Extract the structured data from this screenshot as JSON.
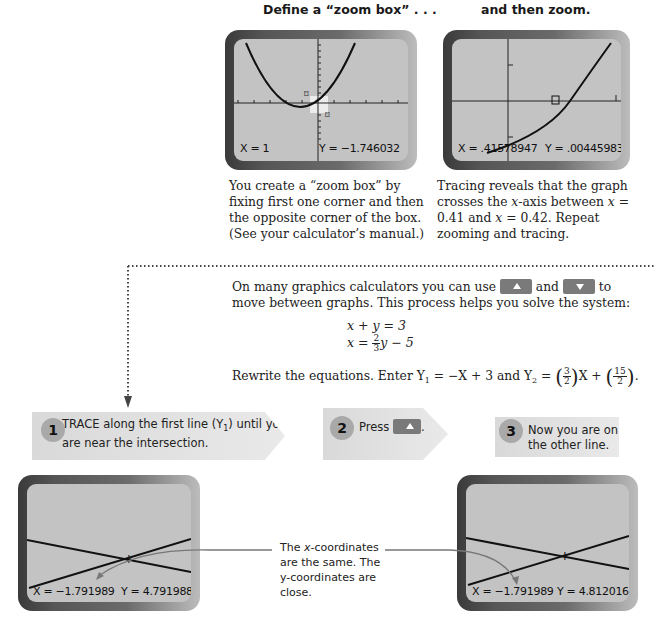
{
  "top": {
    "left_heading": "Define a “zoom box” . . .",
    "right_heading": "and then zoom.",
    "left_screen": {
      "x_readout": "X = 1",
      "y_readout": "Y = −1.746032"
    },
    "right_screen": {
      "x_readout": "X = .41578947",
      "y_readout": "Y = .00445983"
    },
    "left_caption": [
      "You create a “zoom box” by",
      "fixing first one corner and then",
      "the opposite corner of the box.",
      "(See your calculator’s manual.)"
    ],
    "right_caption": {
      "line1": "Tracing reveals that the graph",
      "line2_pre": "crosses the ",
      "line2_var": "x",
      "line2_post": "-axis between ",
      "line2_var2": "x",
      "line2_end": " =",
      "line3_pre": "0.41 and ",
      "line3_var": "x",
      "line3_post": " = 0.42. Repeat",
      "line4": "zooming and tracing."
    }
  },
  "middle": {
    "intro_pre": "On many graphics calculators you can use",
    "intro_and": "and",
    "intro_to": "to",
    "intro_line2": "move between graphs. This process helps you solve the system:",
    "up_key_icon": "up-arrow-key",
    "down_key_icon": "down-arrow-key",
    "eq1": "x + y = 3",
    "eq2_pre": "x = ",
    "eq2_frac_num": "2",
    "eq2_frac_den": "3",
    "eq2_post": "y − 5",
    "rewrite_pre": "Rewrite the equations. Enter Y",
    "rewrite_sub1": "1",
    "rewrite_mid": " = −X + 3 and Y",
    "rewrite_sub2": "2",
    "rewrite_eq": " = ",
    "frac1_num": "3",
    "frac1_den": "2",
    "rewrite_x": "X + ",
    "frac2_num": "15",
    "frac2_den": "2",
    "rewrite_end": "."
  },
  "steps": [
    {
      "num": "1",
      "text_pre": "TRACE along the first line (Y",
      "text_sub": "1",
      "text_post": ") until you",
      "text_line2": "are near the intersection."
    },
    {
      "num": "2",
      "text_pre": "Press",
      "text_post": "."
    },
    {
      "num": "3",
      "text_line1": "Now you are on",
      "text_line2": "the other line."
    }
  ],
  "bottom": {
    "left_screen": {
      "x_readout": "X = −1.791989",
      "y_readout": "Y = 4.7919889"
    },
    "right_screen": {
      "x_readout": "X = −1.791989",
      "y_readout": "Y = 4.8120166"
    },
    "callout": {
      "line1_pre": "The ",
      "line1_var": "x",
      "line1_post": "-coordinates",
      "line2": "are the same. The",
      "line3": "y-coordinates are",
      "line4": "close."
    }
  }
}
